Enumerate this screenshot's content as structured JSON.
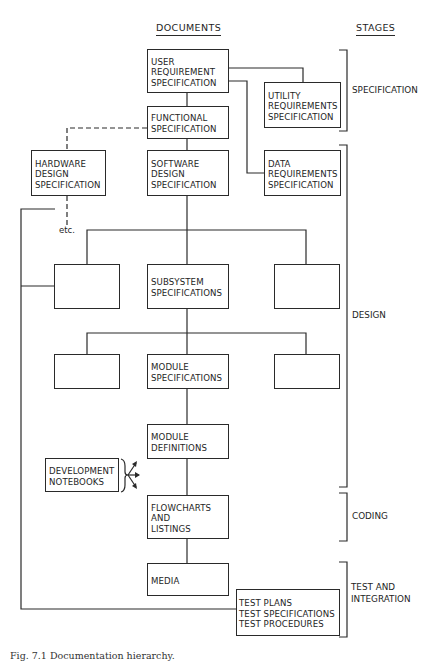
{
  "headers": {
    "documents": "DOCUMENTS",
    "stages": "STAGES"
  },
  "boxes": {
    "user_requirement": "USER\nREQUIREMENT\nSPECIFICATION",
    "utility_requirements": "UTILITY\nREQUIREMENTS\nSPECIFICATION",
    "functional": "FUNCTIONAL\nSPECIFICATION",
    "hardware_design": "HARDWARE\nDESIGN\nSPECIFICATION",
    "software_design": "SOFTWARE\nDESIGN\nSPECIFICATION",
    "data_requirements": "DATA\nREQUIREMENTS\nSPECIFICATION",
    "subsystem_left": "",
    "subsystem": "SUBSYSTEM\nSPECIFICATIONS",
    "subsystem_right": "",
    "module_left": "",
    "module_specifications": "MODULE\nSPECIFICATIONS",
    "module_right": "",
    "module_definitions": "MODULE\nDEFINITIONS",
    "development_notebooks": "DEVELOPMENT\nNOTEBOOKS",
    "flowcharts": "FLOWCHARTS\nAND\nLISTINGS",
    "media": "MEDIA",
    "test": "TEST PLANS\nTEST SPECIFICATIONS\nTEST PROCEDURES"
  },
  "etc_label": "etc.",
  "stages": {
    "specification": "SPECIFICATION",
    "design": "DESIGN",
    "coding": "CODING",
    "test_integration": "TEST AND\nINTEGRATION"
  },
  "caption": "Fig. 7.1 Documentation hierarchy."
}
